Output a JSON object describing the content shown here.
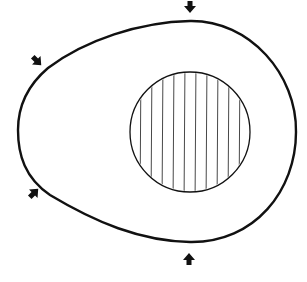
{
  "diagram": {
    "colors": {
      "background": "#ffffff",
      "stroke": "#111111",
      "hatch": "#333333"
    },
    "outer_shape": {
      "label": "egg-shaped outline",
      "left_x": 18,
      "right_x": 296,
      "top_y": 21,
      "bottom_y": 242
    },
    "inner_circle": {
      "label": "hatched circle",
      "cx": 190,
      "cy": 132,
      "r": 60,
      "hatch": "vertical lines"
    },
    "arrows": [
      {
        "name": "arrow-top",
        "direction": "down",
        "x": 190,
        "y": 8
      },
      {
        "name": "arrow-upper-left",
        "direction": "down-right",
        "x": 37,
        "y": 60
      },
      {
        "name": "arrow-lower-left",
        "direction": "up-right",
        "x": 34,
        "y": 193
      },
      {
        "name": "arrow-bottom",
        "direction": "up",
        "x": 189,
        "y": 258
      }
    ]
  }
}
